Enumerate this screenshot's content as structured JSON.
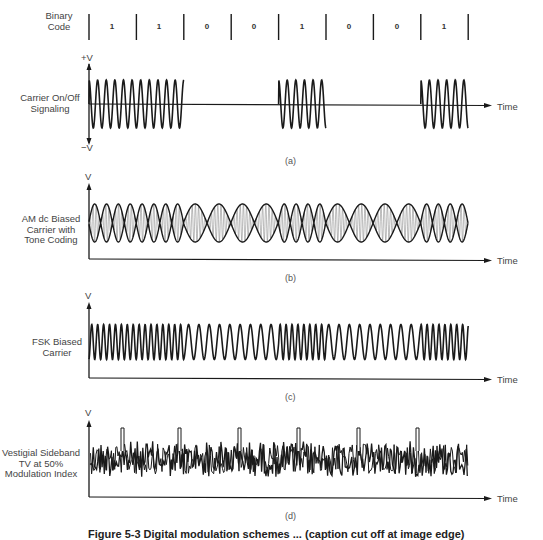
{
  "figure": {
    "binary_code_label": [
      "Binary",
      "Code"
    ],
    "bits": [
      "1",
      "1",
      "0",
      "0",
      "1",
      "0",
      "0",
      "1"
    ],
    "time_label": "Time",
    "caption": "Figure 5-3 Digital modulation schemes ... (caption cut off at image edge)",
    "panels": [
      {
        "tag": "(a)",
        "title_lines": [
          "Carrier On/Off",
          "Signaling"
        ],
        "y_top_label": "+V",
        "y_bottom_label": "−V",
        "type": "on_off_keying"
      },
      {
        "tag": "(b)",
        "title_lines": [
          "AM dc Biased",
          "Carrier with",
          "Tone Coding"
        ],
        "y_top_label": "V",
        "type": "am_tone_coding"
      },
      {
        "tag": "(c)",
        "title_lines": [
          "FSK Biased",
          "Carrier"
        ],
        "y_top_label": "V",
        "type": "fsk"
      },
      {
        "tag": "(d)",
        "title_lines": [
          "Vestigial Sideband",
          "TV at 50%",
          "Modulation Index"
        ],
        "y_top_label": "V",
        "type": "vsb_noise_with_pulses"
      }
    ]
  },
  "chart_data": {
    "type": "line",
    "x": [
      "bit1",
      "bit2",
      "bit3",
      "bit4",
      "bit5",
      "bit6",
      "bit7",
      "bit8"
    ],
    "binary_code": [
      1,
      1,
      0,
      0,
      1,
      0,
      0,
      1
    ],
    "xlabel": "Time",
    "series": [
      {
        "name": "Carrier On/Off Signaling",
        "ylabel": "+V / −V",
        "carrier_on": [
          1,
          1,
          0,
          0,
          1,
          0,
          0,
          1
        ]
      },
      {
        "name": "AM dc Biased Carrier with Tone Coding",
        "ylabel": "V",
        "tone_frequency": [
          "high",
          "high",
          "low",
          "low",
          "high",
          "low",
          "low",
          "high"
        ]
      },
      {
        "name": "FSK Biased Carrier",
        "ylabel": "V",
        "carrier_frequency": [
          "high",
          "high",
          "low",
          "low",
          "high",
          "low",
          "low",
          "high"
        ]
      },
      {
        "name": "Vestigial Sideband TV at 50% Modulation Index",
        "ylabel": "V",
        "pulses_at_bits": [
          1,
          2,
          4,
          5,
          6,
          7
        ]
      }
    ],
    "grid": false,
    "legend": "none"
  },
  "colors": {
    "ink": "#1a1a1a",
    "light_ink": "#555555",
    "background": "#ffffff"
  }
}
